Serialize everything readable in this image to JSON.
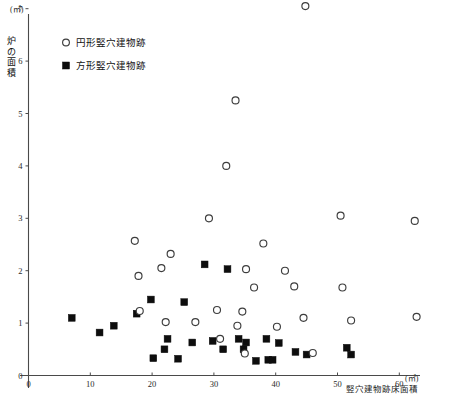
{
  "chart_data": {
    "type": "scatter",
    "title": "",
    "xlabel": "竪穴建物跡床面積",
    "ylabel": "炉の面積",
    "x_unit": "(㎡)",
    "y_unit": "(㎡)",
    "xlim": [
      0,
      65
    ],
    "ylim": [
      0,
      7.3
    ],
    "xticks": [
      0,
      10,
      20,
      30,
      40,
      50,
      60
    ],
    "yticks": [
      0,
      1,
      2,
      3,
      4,
      5,
      6,
      7
    ],
    "xticklabels": [
      "0",
      "10",
      "20",
      "30",
      "40",
      "50",
      "60"
    ],
    "yticklabels": [
      "0",
      "1",
      "2",
      "3",
      "4",
      "5",
      "6",
      "7"
    ],
    "grid": false,
    "legend_position": "top-left-inside",
    "series": [
      {
        "name": "円形竪穴建物跡",
        "marker": "open-circle",
        "color": "#3d3d3d",
        "points": [
          [
            44.8,
            7.05
          ],
          [
            33.5,
            5.25
          ],
          [
            32.0,
            4.0
          ],
          [
            29.2,
            3.0
          ],
          [
            50.5,
            3.05
          ],
          [
            62.5,
            2.95
          ],
          [
            17.2,
            2.57
          ],
          [
            23.0,
            2.32
          ],
          [
            38.0,
            2.52
          ],
          [
            41.5,
            2.0
          ],
          [
            17.8,
            1.9
          ],
          [
            21.5,
            2.05
          ],
          [
            35.2,
            2.03
          ],
          [
            36.5,
            1.68
          ],
          [
            43.0,
            1.7
          ],
          [
            50.8,
            1.68
          ],
          [
            18.0,
            1.23
          ],
          [
            22.2,
            1.02
          ],
          [
            27.0,
            1.02
          ],
          [
            30.5,
            1.25
          ],
          [
            33.8,
            0.95
          ],
          [
            34.6,
            1.22
          ],
          [
            40.2,
            0.93
          ],
          [
            44.5,
            1.1
          ],
          [
            52.2,
            1.05
          ],
          [
            62.8,
            1.12
          ],
          [
            31.0,
            0.7
          ],
          [
            35.0,
            0.42
          ],
          [
            46.0,
            0.43
          ]
        ]
      },
      {
        "name": "方形竪穴建物跡",
        "marker": "filled-square",
        "color": "#0d0d0d",
        "points": [
          [
            28.5,
            2.12
          ],
          [
            32.2,
            2.03
          ],
          [
            19.8,
            1.45
          ],
          [
            25.2,
            1.4
          ],
          [
            7.0,
            1.1
          ],
          [
            11.5,
            0.82
          ],
          [
            13.8,
            0.95
          ],
          [
            17.5,
            1.18
          ],
          [
            22.5,
            0.7
          ],
          [
            26.5,
            0.63
          ],
          [
            29.8,
            0.66
          ],
          [
            34.0,
            0.7
          ],
          [
            35.2,
            0.63
          ],
          [
            38.5,
            0.7
          ],
          [
            40.5,
            0.62
          ],
          [
            43.2,
            0.45
          ],
          [
            45.0,
            0.4
          ],
          [
            51.5,
            0.53
          ],
          [
            52.2,
            0.4
          ],
          [
            20.2,
            0.33
          ],
          [
            22.0,
            0.5
          ],
          [
            24.2,
            0.32
          ],
          [
            31.5,
            0.5
          ],
          [
            34.8,
            0.5
          ],
          [
            36.8,
            0.28
          ],
          [
            38.8,
            0.3
          ],
          [
            39.5,
            0.3
          ]
        ]
      }
    ]
  },
  "legend": {
    "items": [
      {
        "marker": "circle",
        "label": "円形竪穴建物跡"
      },
      {
        "marker": "square",
        "label": "方形竪穴建物跡"
      }
    ]
  },
  "y_axis_title_chars": [
    "炉",
    "の",
    "面",
    "積"
  ],
  "caption": ""
}
